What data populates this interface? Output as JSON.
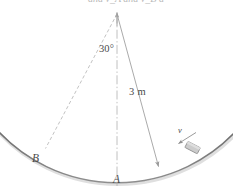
{
  "figure": {
    "title_cropped_line": "and v_A  and v_B   a",
    "labels": {
      "angle": "30°",
      "radius": "3 m",
      "point_a": "A",
      "point_b": "B",
      "velocity": "v"
    },
    "colors": {
      "background": "#ffffff",
      "arc_stroke": "#6f6f6f",
      "line_stroke": "#9a9a9a",
      "dashed_stroke": "#a8a8a8",
      "centerline_stroke": "#aaaaaa",
      "block_fill": "#c9c9c9",
      "block_stroke": "#8a8a8a",
      "text": "#4a4a4a"
    },
    "geometry": {
      "center_x": 117,
      "center_y": 12,
      "radius_px": 163,
      "arc_lowest_point_y": 175,
      "angle_degrees": 30,
      "radius_meters": "3 m",
      "point_a_x": 117,
      "point_a_y": 175,
      "point_b_x": 45,
      "point_b_y": 149,
      "block_x": 192,
      "block_y": 148
    }
  }
}
